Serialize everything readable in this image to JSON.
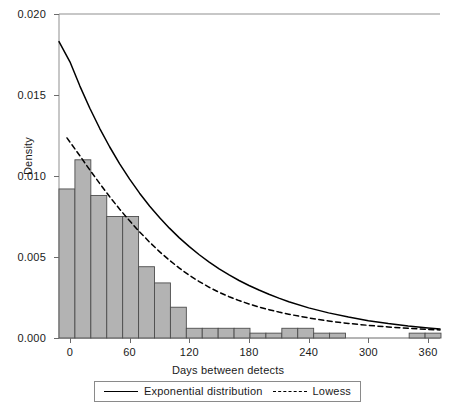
{
  "chart_data": {
    "type": "bar",
    "title": "",
    "subtitle": "",
    "xlabel": "Days between detects",
    "ylabel": "Density",
    "xlim": [
      -11,
      372
    ],
    "ylim": [
      0.0,
      0.02
    ],
    "xticks": [
      0,
      60,
      120,
      180,
      240,
      300,
      360
    ],
    "xticklabels": [
      "0",
      "60",
      "120",
      "180",
      "240",
      "300",
      "360"
    ],
    "yticks": [
      0.0,
      0.005,
      0.01,
      0.015,
      0.02
    ],
    "yticklabels": [
      "0.000",
      "0.005",
      "0.010",
      "0.015",
      "0.020"
    ],
    "grid": false,
    "bar_color": "#b3b3b3",
    "bar_edge_color": "#4d4d4d",
    "bin_width": 16,
    "bins": [
      {
        "left": -11,
        "right": 5,
        "density": 0.0092
      },
      {
        "left": 5,
        "right": 21,
        "density": 0.011
      },
      {
        "left": 21,
        "right": 37,
        "density": 0.0088
      },
      {
        "left": 37,
        "right": 53,
        "density": 0.0075
      },
      {
        "left": 53,
        "right": 69,
        "density": 0.0075
      },
      {
        "left": 69,
        "right": 85,
        "density": 0.0044
      },
      {
        "left": 85,
        "right": 101,
        "density": 0.0034
      },
      {
        "left": 101,
        "right": 117,
        "density": 0.0019
      },
      {
        "left": 117,
        "right": 133,
        "density": 0.0006
      },
      {
        "left": 133,
        "right": 149,
        "density": 0.0006
      },
      {
        "left": 149,
        "right": 165,
        "density": 0.0006
      },
      {
        "left": 165,
        "right": 181,
        "density": 0.0006
      },
      {
        "left": 181,
        "right": 197,
        "density": 0.0003
      },
      {
        "left": 197,
        "right": 213,
        "density": 0.0003
      },
      {
        "left": 213,
        "right": 229,
        "density": 0.0006
      },
      {
        "left": 229,
        "right": 245,
        "density": 0.0006
      },
      {
        "left": 245,
        "right": 261,
        "density": 0.0003
      },
      {
        "left": 261,
        "right": 277,
        "density": 0.0003
      },
      {
        "left": 341,
        "right": 357,
        "density": 0.0003
      },
      {
        "left": 357,
        "right": 373,
        "density": 0.0003
      }
    ],
    "series": [
      {
        "name": "Exponential distribution",
        "style": "solid",
        "color": "#000000",
        "x": [
          -11,
          0,
          10,
          20,
          30,
          40,
          50,
          60,
          70,
          80,
          90,
          100,
          110,
          120,
          130,
          140,
          150,
          160,
          170,
          180,
          190,
          200,
          210,
          220,
          240,
          260,
          280,
          300,
          320,
          340,
          360,
          372
        ],
        "y": [
          0.0183,
          0.01705,
          0.01555,
          0.01418,
          0.01293,
          0.01179,
          0.01075,
          0.00981,
          0.00894,
          0.00815,
          0.00744,
          0.00678,
          0.00618,
          0.00564,
          0.00514,
          0.00469,
          0.00427,
          0.0039,
          0.00355,
          0.00324,
          0.00296,
          0.0027,
          0.00246,
          0.00224,
          0.00186,
          0.00155,
          0.00129,
          0.00107,
          0.00089,
          0.00074,
          0.00062,
          0.00055
        ]
      },
      {
        "name": "Lowess",
        "style": "dashed",
        "color": "#000000",
        "x": [
          -3,
          10,
          20,
          30,
          40,
          50,
          60,
          70,
          80,
          90,
          100,
          110,
          120,
          130,
          140,
          150,
          160,
          170,
          180,
          190,
          200,
          210,
          220,
          230,
          240,
          250,
          260,
          270,
          280,
          300,
          320,
          340,
          360,
          372
        ],
        "y": [
          0.01235,
          0.01125,
          0.01037,
          0.00953,
          0.00872,
          0.00795,
          0.00723,
          0.00655,
          0.00592,
          0.00533,
          0.0048,
          0.00431,
          0.00387,
          0.00348,
          0.00313,
          0.00282,
          0.00255,
          0.00231,
          0.0021,
          0.00191,
          0.00175,
          0.0016,
          0.00147,
          0.00135,
          0.00124,
          0.00114,
          0.00105,
          0.00097,
          0.0009,
          0.00078,
          0.00068,
          0.0006,
          0.00053,
          0.0005
        ]
      }
    ],
    "legend": {
      "position": "bottom-center",
      "entries": [
        {
          "label": "Exponential distribution",
          "style": "solid"
        },
        {
          "label": "Lowess",
          "style": "dashed"
        }
      ]
    }
  }
}
